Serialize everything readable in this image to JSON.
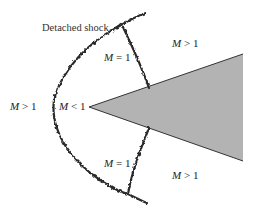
{
  "diagram": {
    "title_label": "Detached shock",
    "wedge_fill": "#b3b3b3",
    "wedge_stroke": "#333333",
    "shock_color": "#2a2a2a",
    "regions": [
      {
        "id": "upstream",
        "var": "M",
        "rel": " > 1"
      },
      {
        "id": "stagnation",
        "var": "M",
        "rel": " < 1"
      },
      {
        "id": "sonic-upper",
        "var": "M",
        "rel": " = 1"
      },
      {
        "id": "sonic-lower",
        "var": "M",
        "rel": " = 1"
      },
      {
        "id": "downstream-upper",
        "var": "M",
        "rel": " > 1"
      },
      {
        "id": "downstream-lower",
        "var": "M",
        "rel": " > 1"
      }
    ]
  }
}
